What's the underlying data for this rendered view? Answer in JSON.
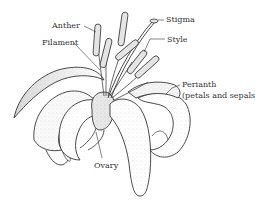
{
  "diagram": {
    "labels": {
      "anther": "Anther",
      "filament": "Filament",
      "stigma": "Stigma",
      "style": "Style",
      "perianth_line1": "Perianth",
      "perianth_line2": "(petals and sepals)",
      "ovary": "Ovary"
    },
    "colors": {
      "background": "#ffffff",
      "ink": "#333333",
      "shade": "#9a9a9a"
    }
  }
}
